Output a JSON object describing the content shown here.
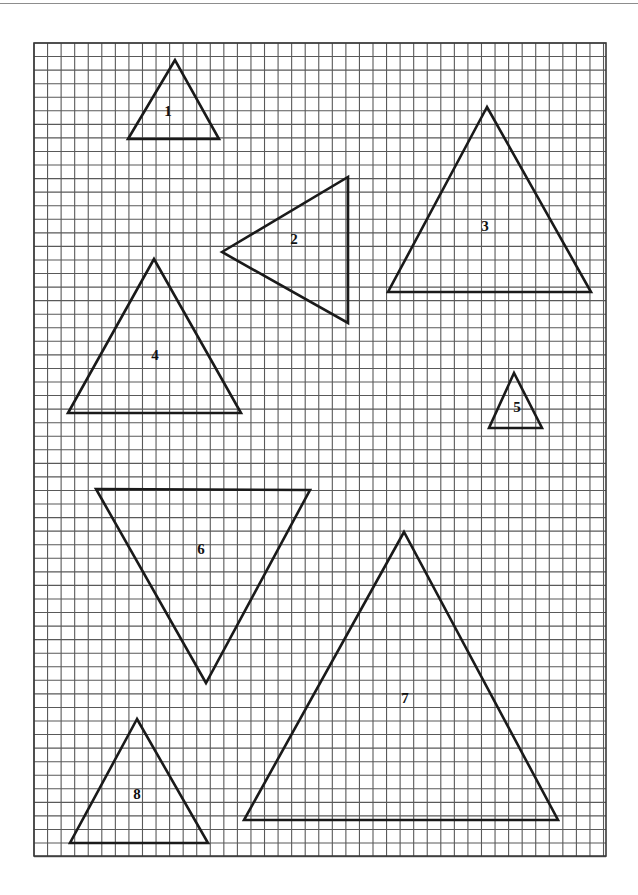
{
  "page": {
    "width": 638,
    "height": 895,
    "background_color": "#ffffff",
    "top_rule_color": "#8d8d8d"
  },
  "grid": {
    "name": "graph-paper-grid",
    "x": 34,
    "y": 43,
    "width": 572,
    "height": 813,
    "cell_size": 13.56,
    "line_color": "#595959",
    "line_width": 1.1,
    "border_color": "#3a3a3a",
    "border_width": 1.6,
    "columns": 42,
    "rows": 60
  },
  "chart_data": {
    "type": "diagram",
    "xlabel": "",
    "ylabel": "",
    "grid": true,
    "legend_position": "none",
    "units": "grid cells (1 cell = 13.56 px)",
    "shape_kind": "triangle",
    "shapes": [
      {
        "id": 1,
        "label": "1",
        "orientation": "apex-up",
        "vertices_px": [
          [
            175,
            60
          ],
          [
            128,
            139
          ],
          [
            219,
            139
          ]
        ],
        "label_px": [
          168,
          113
        ],
        "base_cells": 6.7,
        "height_cells": 5.8
      },
      {
        "id": 2,
        "label": "2",
        "orientation": "apex-left",
        "vertices_px": [
          [
            222,
            252
          ],
          [
            348,
            177
          ],
          [
            348,
            323
          ]
        ],
        "label_px": [
          294,
          241
        ],
        "base_cells": 10.8,
        "height_cells": 9.3
      },
      {
        "id": 3,
        "label": "3",
        "orientation": "apex-up",
        "vertices_px": [
          [
            487,
            107
          ],
          [
            388,
            292
          ],
          [
            591,
            292
          ]
        ],
        "label_px": [
          485,
          228
        ],
        "base_cells": 15.0,
        "height_cells": 13.6
      },
      {
        "id": 4,
        "label": "4",
        "orientation": "apex-up",
        "vertices_px": [
          [
            154,
            259
          ],
          [
            68,
            413
          ],
          [
            241,
            413
          ]
        ],
        "label_px": [
          155,
          357
        ],
        "base_cells": 12.8,
        "height_cells": 11.4
      },
      {
        "id": 5,
        "label": "5",
        "orientation": "apex-up",
        "vertices_px": [
          [
            514,
            373
          ],
          [
            489,
            428
          ],
          [
            542,
            428
          ]
        ],
        "label_px": [
          517,
          409
        ],
        "base_cells": 3.9,
        "height_cells": 4.1
      },
      {
        "id": 6,
        "label": "6",
        "orientation": "apex-down",
        "vertices_px": [
          [
            96,
            489
          ],
          [
            310,
            490
          ],
          [
            206,
            683
          ]
        ],
        "label_px": [
          201,
          551
        ],
        "base_cells": 15.8,
        "height_cells": 14.3
      },
      {
        "id": 7,
        "label": "7",
        "orientation": "apex-up",
        "vertices_px": [
          [
            404,
            532
          ],
          [
            244,
            820
          ],
          [
            558,
            820
          ]
        ],
        "label_px": [
          405,
          700
        ],
        "base_cells": 23.2,
        "height_cells": 21.2
      },
      {
        "id": 8,
        "label": "8",
        "orientation": "apex-up",
        "vertices_px": [
          [
            137,
            719
          ],
          [
            70,
            843
          ],
          [
            208,
            843
          ]
        ],
        "label_px": [
          137,
          796
        ],
        "base_cells": 10.2,
        "height_cells": 9.1
      }
    ],
    "stroke_color": "#1a1a1a",
    "stroke_width": 2.6,
    "label_color": "#111111"
  }
}
